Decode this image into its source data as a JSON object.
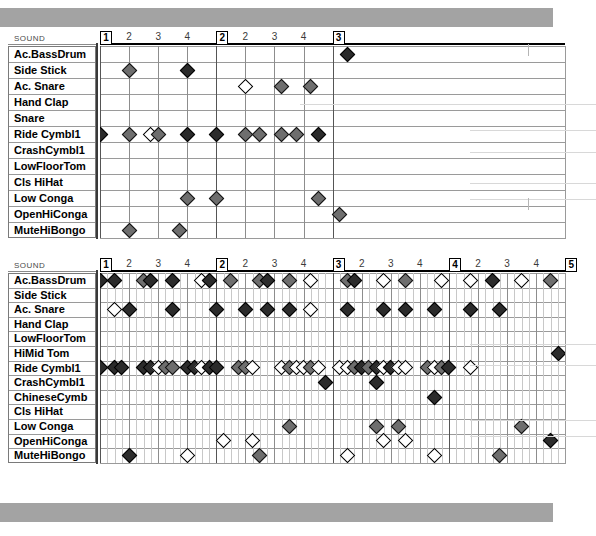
{
  "window": {
    "title": "Drum Editor",
    "top_bar_color": "#a3a3a3",
    "note_colors": {
      "high": "#2b2b2b",
      "medium": "#6e6e6e",
      "low": "#ffffff"
    }
  },
  "panels": [
    {
      "id": "drum-editor-panel-1",
      "column_header": "SOUND",
      "x": 8,
      "y": 30,
      "name_w": 88,
      "grid_w": 465,
      "row_h": 16,
      "col_w": 7.27,
      "bars": 2,
      "beats_per_bar": 4,
      "subdiv": 4,
      "ruler": [
        {
          "label": "1",
          "bar": true,
          "col": 0
        },
        {
          "label": "2",
          "bar": false,
          "col": 4
        },
        {
          "label": "3",
          "bar": false,
          "col": 8
        },
        {
          "label": "4",
          "bar": false,
          "col": 12
        },
        {
          "label": "2",
          "bar": true,
          "col": 16
        },
        {
          "label": "2",
          "bar": false,
          "col": 20
        },
        {
          "label": "3",
          "bar": false,
          "col": 24
        },
        {
          "label": "4",
          "bar": false,
          "col": 28
        },
        {
          "label": "3",
          "bar": true,
          "col": 32
        }
      ],
      "rows": [
        {
          "label": "Ac.BassDrum",
          "notes": []
        },
        {
          "label": "Side Stick",
          "notes": [
            [
              4,
              "md"
            ],
            [
              12,
              "hi"
            ]
          ]
        },
        {
          "label": "Ac. Snare",
          "notes": [
            [
              20,
              "lo"
            ],
            [
              25,
              "md"
            ],
            [
              29,
              "md"
            ]
          ]
        },
        {
          "label": "Hand Clap",
          "notes": []
        },
        {
          "label": "Snare",
          "notes": []
        },
        {
          "label": "Ride Cymbl1",
          "notes": [
            [
              0,
              "hi"
            ],
            [
              4,
              "md"
            ],
            [
              7,
              "lo"
            ],
            [
              8,
              "md"
            ],
            [
              12,
              "hi"
            ],
            [
              16,
              "hi"
            ],
            [
              20,
              "md"
            ],
            [
              22,
              "md"
            ],
            [
              25,
              "md"
            ],
            [
              27,
              "md"
            ],
            [
              30,
              "hi"
            ]
          ]
        },
        {
          "label": "CrashCymbl1",
          "notes": []
        },
        {
          "label": "LowFloorTom",
          "notes": []
        },
        {
          "label": "Cls HiHat",
          "notes": []
        },
        {
          "label": "Low Conga",
          "notes": [
            [
              12,
              "md"
            ],
            [
              16,
              "md"
            ],
            [
              30,
              "md"
            ]
          ]
        },
        {
          "label": "OpenHiConga",
          "notes": [
            [
              33,
              "md"
            ]
          ]
        },
        {
          "label": "MuteHiBongo",
          "notes": [
            [
              4,
              "md"
            ],
            [
              11,
              "md"
            ]
          ]
        }
      ],
      "floating_notes": [
        {
          "row": 0,
          "col": 34,
          "shade": "hi"
        }
      ]
    },
    {
      "id": "drum-editor-panel-2",
      "column_header": "SOUND",
      "x": 8,
      "y": 257,
      "name_w": 88,
      "grid_w": 465,
      "row_h": 14.6,
      "col_w": 7.27,
      "bars": 4,
      "beats_per_bar": 4,
      "subdiv": 4,
      "ruler": [
        {
          "label": "1",
          "bar": true,
          "col": 0
        },
        {
          "label": "2",
          "bar": false,
          "col": 4
        },
        {
          "label": "3",
          "bar": false,
          "col": 8
        },
        {
          "label": "4",
          "bar": false,
          "col": 12
        },
        {
          "label": "2",
          "bar": true,
          "col": 16
        },
        {
          "label": "2",
          "bar": false,
          "col": 20
        },
        {
          "label": "3",
          "bar": false,
          "col": 24
        },
        {
          "label": "4",
          "bar": false,
          "col": 28
        },
        {
          "label": "3",
          "bar": true,
          "col": 32
        },
        {
          "label": "2",
          "bar": false,
          "col": 36
        },
        {
          "label": "3",
          "bar": false,
          "col": 40
        },
        {
          "label": "4",
          "bar": false,
          "col": 44
        },
        {
          "label": "4",
          "bar": true,
          "col": 48
        },
        {
          "label": "2",
          "bar": false,
          "col": 52
        },
        {
          "label": "3",
          "bar": false,
          "col": 56
        },
        {
          "label": "4",
          "bar": false,
          "col": 60
        },
        {
          "label": "5",
          "bar": true,
          "col": 64
        }
      ],
      "rows": [
        {
          "label": "Ac.BassDrum",
          "notes": [
            [
              0,
              "hi"
            ],
            [
              2,
              "hi"
            ],
            [
              6,
              "md"
            ],
            [
              7,
              "hi"
            ],
            [
              10,
              "hi"
            ],
            [
              14,
              "lo"
            ],
            [
              15,
              "hi"
            ],
            [
              18,
              "md"
            ],
            [
              22,
              "md"
            ],
            [
              23,
              "hi"
            ],
            [
              26,
              "md"
            ],
            [
              29,
              "lo"
            ],
            [
              34,
              "md"
            ],
            [
              35,
              "hi"
            ],
            [
              39,
              "lo"
            ],
            [
              42,
              "md"
            ],
            [
              47,
              "lo"
            ],
            [
              51,
              "lo"
            ],
            [
              54,
              "hi"
            ],
            [
              58,
              "lo"
            ],
            [
              62,
              "md"
            ]
          ]
        },
        {
          "label": "Side Stick",
          "notes": []
        },
        {
          "label": "Ac. Snare",
          "notes": [
            [
              2,
              "lo"
            ],
            [
              4,
              "hi"
            ],
            [
              10,
              "hi"
            ],
            [
              16,
              "hi"
            ],
            [
              20,
              "hi"
            ],
            [
              23,
              "hi"
            ],
            [
              26,
              "hi"
            ],
            [
              29,
              "lo"
            ],
            [
              34,
              "hi"
            ],
            [
              39,
              "hi"
            ],
            [
              42,
              "hi"
            ],
            [
              46,
              "hi"
            ],
            [
              51,
              "hi"
            ],
            [
              55,
              "hi"
            ]
          ]
        },
        {
          "label": "Hand Clap",
          "notes": []
        },
        {
          "label": "LowFloorTom",
          "notes": []
        },
        {
          "label": "HiMid Tom",
          "notes": [
            [
              63,
              "hi"
            ]
          ]
        },
        {
          "label": "Ride Cymbl1",
          "notes": [
            [
              0,
              "hi"
            ],
            [
              2,
              "hi"
            ],
            [
              3,
              "hi"
            ],
            [
              6,
              "hi"
            ],
            [
              7,
              "hi"
            ],
            [
              8,
              "lo"
            ],
            [
              9,
              "md"
            ],
            [
              10,
              "md"
            ],
            [
              12,
              "hi"
            ],
            [
              13,
              "hi"
            ],
            [
              14,
              "lo"
            ],
            [
              15,
              "hi"
            ],
            [
              16,
              "hi"
            ],
            [
              19,
              "md"
            ],
            [
              20,
              "md"
            ],
            [
              21,
              "lo"
            ],
            [
              25,
              "lo"
            ],
            [
              26,
              "md"
            ],
            [
              27,
              "lo"
            ],
            [
              28,
              "lo"
            ],
            [
              29,
              "md"
            ],
            [
              30,
              "lo"
            ],
            [
              33,
              "lo"
            ],
            [
              34,
              "lo"
            ],
            [
              35,
              "md"
            ],
            [
              36,
              "hi"
            ],
            [
              37,
              "md"
            ],
            [
              38,
              "hi"
            ],
            [
              39,
              "lo"
            ],
            [
              40,
              "hi"
            ],
            [
              41,
              "lo"
            ],
            [
              42,
              "lo"
            ],
            [
              45,
              "md"
            ],
            [
              46,
              "lo"
            ],
            [
              47,
              "md"
            ],
            [
              48,
              "hi"
            ],
            [
              51,
              "lo"
            ]
          ]
        },
        {
          "label": "CrashCymbl1",
          "notes": [
            [
              31,
              "hi"
            ],
            [
              38,
              "hi"
            ]
          ]
        },
        {
          "label": "ChineseCymb",
          "notes": [
            [
              46,
              "hi"
            ]
          ]
        },
        {
          "label": "Cls HiHat",
          "notes": []
        },
        {
          "label": "Low Conga",
          "notes": [
            [
              26,
              "md"
            ],
            [
              38,
              "md"
            ],
            [
              41,
              "md"
            ],
            [
              58,
              "md"
            ]
          ]
        },
        {
          "label": "OpenHiConga",
          "notes": [
            [
              17,
              "lo"
            ],
            [
              21,
              "lo"
            ],
            [
              39,
              "lo"
            ],
            [
              42,
              "lo"
            ],
            [
              62,
              "hi"
            ]
          ]
        },
        {
          "label": "MuteHiBongo",
          "notes": [
            [
              4,
              "hi"
            ],
            [
              12,
              "lo"
            ],
            [
              22,
              "md"
            ],
            [
              34,
              "lo"
            ],
            [
              46,
              "lo"
            ],
            [
              55,
              "md"
            ]
          ]
        }
      ],
      "floating_notes": []
    }
  ]
}
